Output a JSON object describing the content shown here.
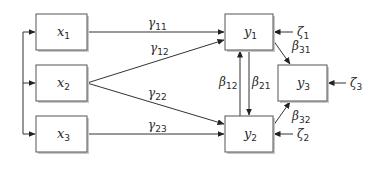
{
  "diagram": {
    "type": "path-diagram",
    "nodes": {
      "x1": {
        "base": "x",
        "sub": "1"
      },
      "x2": {
        "base": "x",
        "sub": "2"
      },
      "x3": {
        "base": "x",
        "sub": "3"
      },
      "y1": {
        "base": "y",
        "sub": "1"
      },
      "y2": {
        "base": "y",
        "sub": "2"
      },
      "y3": {
        "base": "y",
        "sub": "3"
      }
    },
    "disturbances": {
      "z1": {
        "base": "ζ",
        "sub": "1"
      },
      "z2": {
        "base": "ζ",
        "sub": "2"
      },
      "z3": {
        "base": "ζ",
        "sub": "3"
      }
    },
    "paths": {
      "g11": {
        "base": "γ",
        "sub": "11",
        "from": "x1",
        "to": "y1"
      },
      "g12": {
        "base": "γ",
        "sub": "12",
        "from": "x2",
        "to": "y1"
      },
      "g22": {
        "base": "γ",
        "sub": "22",
        "from": "x2",
        "to": "y2"
      },
      "g23": {
        "base": "γ",
        "sub": "23",
        "from": "x3",
        "to": "y2"
      },
      "b12": {
        "base": "β",
        "sub": "12",
        "from": "y2",
        "to": "y1"
      },
      "b21": {
        "base": "β",
        "sub": "21",
        "from": "y1",
        "to": "y2"
      },
      "b31": {
        "base": "β",
        "sub": "31",
        "from": "y1",
        "to": "y3"
      },
      "b32": {
        "base": "β",
        "sub": "32",
        "from": "y2",
        "to": "y3"
      }
    }
  }
}
